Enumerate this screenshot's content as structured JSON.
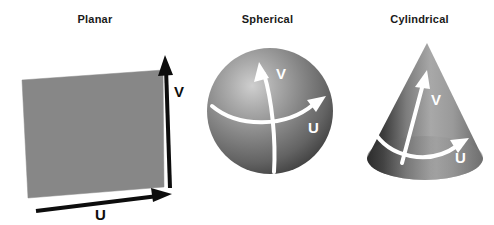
{
  "figure": {
    "background_color": "#ffffff",
    "panels": [
      {
        "id": "planar",
        "title": "Planar",
        "shape": "quadrilateral",
        "fill_color": "#878787",
        "axes": [
          {
            "name": "V",
            "label": "V",
            "direction": "up",
            "color": "#0d0d0d"
          },
          {
            "name": "U",
            "label": "U",
            "direction": "right",
            "color": "#0d0d0d"
          }
        ]
      },
      {
        "id": "spherical",
        "title": "Spherical",
        "shape": "sphere",
        "fill_color": "#7a7a7a",
        "highlight_color": "#c9c9c9",
        "shadow_color": "#3a3a3a",
        "axes": [
          {
            "name": "V",
            "label": "V",
            "direction": "up",
            "color": "#ffffff"
          },
          {
            "name": "U",
            "label": "U",
            "direction": "right",
            "color": "#ffffff"
          }
        ]
      },
      {
        "id": "cylindrical",
        "title": "Cylindrical",
        "shape": "cone",
        "fill_color": "#8f8f8f",
        "highlight_color": "#b5b5b5",
        "shadow_color": "#2b2b2b",
        "axes": [
          {
            "name": "V",
            "label": "V",
            "direction": "up",
            "color": "#ffffff"
          },
          {
            "name": "U",
            "label": "U",
            "direction": "right",
            "color": "#ffffff"
          }
        ]
      }
    ]
  }
}
